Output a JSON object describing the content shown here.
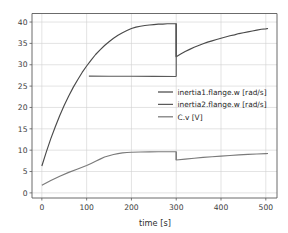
{
  "chart_data": {
    "type": "line",
    "title": "",
    "xlabel": "time [s]",
    "ylabel": "",
    "xlim": [
      -22,
      525
    ],
    "ylim": [
      -1.2,
      42.0
    ],
    "xticks": [
      0,
      100,
      200,
      300,
      400,
      500
    ],
    "yticks": [
      0,
      5,
      10,
      15,
      20,
      25,
      30,
      35,
      40
    ],
    "grid": true,
    "legend_position": "center-right",
    "colors": {
      "inertia1": "#4a4a4a",
      "inertia2": "#5a5a5a",
      "cv": "#7a7a7a",
      "grid": "#d0d0d0",
      "axis": "#5a5a5a",
      "background": "#ffffff"
    },
    "series": [
      {
        "name": "inertia1.flange.w [rad/s]",
        "color": "#4a4a4a",
        "points": [
          [
            0,
            6.3
          ],
          [
            10,
            9.6
          ],
          [
            20,
            12.7
          ],
          [
            30,
            15.5
          ],
          [
            40,
            18.1
          ],
          [
            50,
            20.5
          ],
          [
            60,
            22.7
          ],
          [
            70,
            24.7
          ],
          [
            80,
            26.5
          ],
          [
            90,
            28.2
          ],
          [
            100,
            29.7
          ],
          [
            110,
            31.1
          ],
          [
            120,
            32.4
          ],
          [
            130,
            33.5
          ],
          [
            140,
            34.5
          ],
          [
            150,
            35.4
          ],
          [
            160,
            36.2
          ],
          [
            170,
            36.9
          ],
          [
            180,
            37.5
          ],
          [
            190,
            38.0
          ],
          [
            200,
            38.5
          ],
          [
            210,
            38.8
          ],
          [
            220,
            39.0
          ],
          [
            230,
            39.2
          ],
          [
            240,
            39.3
          ],
          [
            250,
            39.4
          ],
          [
            260,
            39.5
          ],
          [
            270,
            39.5
          ],
          [
            280,
            39.6
          ],
          [
            290,
            39.6
          ],
          [
            300,
            39.6
          ],
          [
            300.01,
            31.9
          ],
          [
            310,
            32.5
          ],
          [
            320,
            33.1
          ],
          [
            330,
            33.6
          ],
          [
            340,
            34.1
          ],
          [
            350,
            34.5
          ],
          [
            360,
            34.9
          ],
          [
            370,
            35.3
          ],
          [
            380,
            35.6
          ],
          [
            390,
            35.9
          ],
          [
            400,
            36.2
          ],
          [
            410,
            36.5
          ],
          [
            420,
            36.8
          ],
          [
            430,
            37.0
          ],
          [
            440,
            37.3
          ],
          [
            450,
            37.5
          ],
          [
            460,
            37.7
          ],
          [
            470,
            37.9
          ],
          [
            480,
            38.1
          ],
          [
            490,
            38.3
          ],
          [
            500,
            38.4
          ],
          [
            505,
            38.5
          ]
        ]
      },
      {
        "name": "inertia2.flange.w [rad/s]",
        "color": "#5a5a5a",
        "points": [
          [
            105,
            27.35
          ],
          [
            150,
            27.32
          ],
          [
            200,
            27.3
          ],
          [
            250,
            27.28
          ],
          [
            300,
            27.25
          ]
        ]
      },
      {
        "name": "C.v [V]",
        "color": "#7a7a7a",
        "points": [
          [
            0,
            1.8
          ],
          [
            20,
            2.9
          ],
          [
            40,
            3.9
          ],
          [
            60,
            4.8
          ],
          [
            80,
            5.6
          ],
          [
            100,
            6.4
          ],
          [
            110,
            6.9
          ],
          [
            120,
            7.4
          ],
          [
            130,
            7.9
          ],
          [
            140,
            8.4
          ],
          [
            150,
            8.7
          ],
          [
            160,
            9.0
          ],
          [
            170,
            9.2
          ],
          [
            180,
            9.35
          ],
          [
            190,
            9.45
          ],
          [
            200,
            9.52
          ],
          [
            220,
            9.58
          ],
          [
            240,
            9.6
          ],
          [
            260,
            9.62
          ],
          [
            280,
            9.63
          ],
          [
            300,
            9.63
          ],
          [
            300.01,
            7.7
          ],
          [
            320,
            7.9
          ],
          [
            340,
            8.1
          ],
          [
            360,
            8.3
          ],
          [
            380,
            8.45
          ],
          [
            400,
            8.6
          ],
          [
            420,
            8.75
          ],
          [
            440,
            8.9
          ],
          [
            460,
            9.0
          ],
          [
            480,
            9.1
          ],
          [
            500,
            9.2
          ],
          [
            505,
            9.22
          ]
        ]
      }
    ],
    "legend_entries": [
      {
        "label": "inertia1.flange.w [rad/s]",
        "color": "#4a4a4a"
      },
      {
        "label": "inertia2.flange.w [rad/s]",
        "color": "#5a5a5a"
      },
      {
        "label": "C.v [V]",
        "color": "#7a7a7a"
      }
    ]
  }
}
